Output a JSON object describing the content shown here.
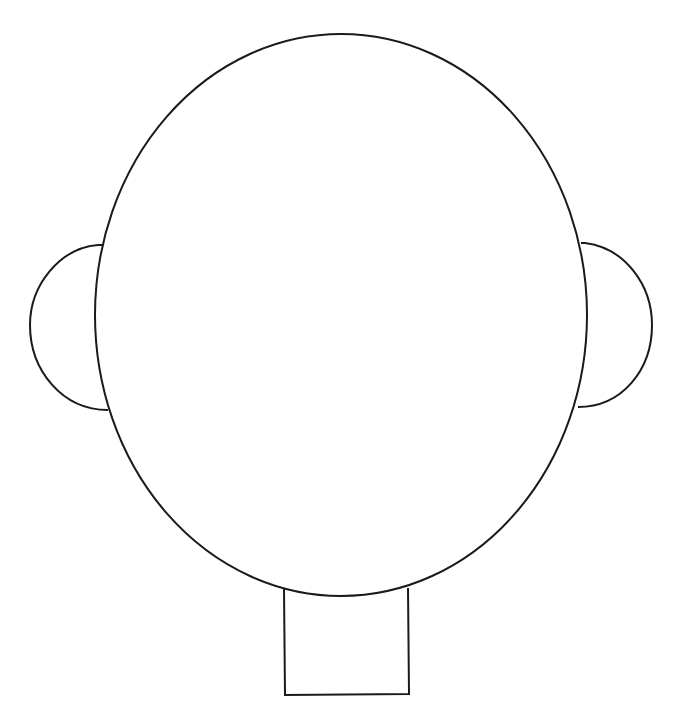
{
  "drawing": {
    "subject": "head outline template",
    "stroke_color": "#1a1a1a",
    "background": "#ffffff",
    "parts": [
      "head",
      "left-ear",
      "right-ear",
      "neck"
    ]
  }
}
